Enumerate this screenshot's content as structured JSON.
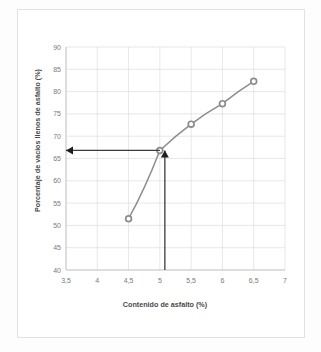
{
  "page": {
    "background_color": "#fdfdfd",
    "frame_color": "#e2e2e2",
    "caption": ""
  },
  "chart_data": {
    "type": "line",
    "title": "",
    "subtitle": "",
    "xlabel": "Contenido de asfalto (%)",
    "ylabel": "Porcentaje de vacios llenos de asfalto (%)",
    "xlim": [
      3.5,
      7
    ],
    "ylim": [
      40,
      90
    ],
    "xticks": [
      3.5,
      4,
      4.5,
      5,
      5.5,
      6,
      6.5,
      7
    ],
    "xtick_labels": [
      "3,5",
      "4",
      "4,5",
      "5",
      "5,5",
      "6",
      "6,5",
      "7"
    ],
    "yticks": [
      40,
      45,
      50,
      55,
      60,
      65,
      70,
      75,
      80,
      85,
      90
    ],
    "ytick_labels": [
      "40",
      "45",
      "50",
      "55",
      "60",
      "65",
      "70",
      "75",
      "80",
      "85",
      "90"
    ],
    "grid": true,
    "legend": false,
    "legend_position": "none",
    "series": [
      {
        "name": "Porcentaje de vacios llenos de asfalto",
        "marker": "circle",
        "line_color": "#8c8c8c",
        "marker_color": "#8c8c8c",
        "x": [
          4.5,
          5.0,
          5.5,
          6.0,
          6.5
        ],
        "values": [
          51.5,
          66.8,
          72.7,
          77.3,
          82.3
        ]
      }
    ],
    "annotations": [
      {
        "name": "vertical-guide-arrow",
        "type": "arrow",
        "from_x": 5.08,
        "from_y": 40,
        "to_x": 5.08,
        "to_y": 66.8,
        "color": "#3b3b3b",
        "label": ""
      },
      {
        "name": "horizontal-guide-arrow",
        "type": "arrow",
        "from_x": 5.0,
        "from_y": 66.8,
        "to_x": 3.5,
        "to_y": 66.8,
        "color": "#3b3b3b",
        "label": ""
      }
    ],
    "read_off_values": {
      "asphalt_content": 5.08,
      "voids_filled_with_asphalt": 66.8
    }
  }
}
